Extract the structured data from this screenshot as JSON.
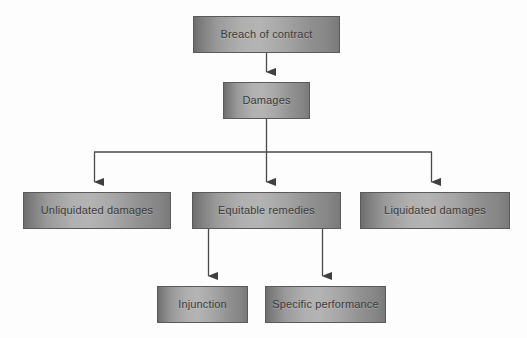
{
  "diagram": {
    "background_color": "#fdfdfd",
    "box_border_color": "#5a5a5a",
    "box_text_color": "#3b3b3b",
    "connector_color": "#4a4a4a",
    "nodes": [
      {
        "id": "breach",
        "label": "Breach of contract",
        "x": 193,
        "y": 16,
        "w": 147,
        "h": 37
      },
      {
        "id": "damages",
        "label": "Damages",
        "x": 223,
        "y": 82,
        "w": 87,
        "h": 37
      },
      {
        "id": "unliquidated",
        "label": "Unliquidated damages",
        "x": 23,
        "y": 192,
        "w": 148,
        "h": 37
      },
      {
        "id": "equitable",
        "label": "Equitable remedies",
        "x": 192,
        "y": 192,
        "w": 149,
        "h": 37
      },
      {
        "id": "liquidated",
        "label": "Liquidated damages",
        "x": 360,
        "y": 192,
        "w": 150,
        "h": 37
      },
      {
        "id": "injunction",
        "label": "Injunction",
        "x": 157,
        "y": 286,
        "w": 91,
        "h": 37
      },
      {
        "id": "specific",
        "label": "Specific performance",
        "x": 265,
        "y": 286,
        "w": 121,
        "h": 37
      }
    ],
    "edges": [
      {
        "id": "breach-to-damages",
        "from": "breach",
        "to": "damages"
      },
      {
        "id": "damages-to-unliquidated",
        "from": "damages",
        "to": "unliquidated"
      },
      {
        "id": "damages-to-equitable",
        "from": "damages",
        "to": "equitable"
      },
      {
        "id": "damages-to-liquidated",
        "from": "damages",
        "to": "liquidated"
      },
      {
        "id": "equitable-to-injunction",
        "from": "equitable",
        "to": "injunction"
      },
      {
        "id": "equitable-to-specific",
        "from": "equitable",
        "to": "specific"
      }
    ]
  }
}
